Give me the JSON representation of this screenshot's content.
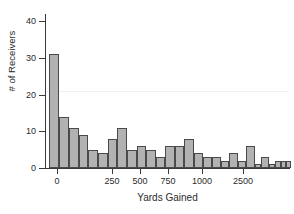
{
  "chart_data": {
    "type": "bar",
    "title": "",
    "xlabel": "Yards Gained",
    "ylabel": "# of Receivers",
    "grid": false,
    "legend": null,
    "ylim": [
      0,
      42
    ],
    "yticks": [
      0,
      10,
      20,
      30,
      40
    ],
    "ytick_labels": [
      "0",
      "10",
      "20",
      "30",
      "40"
    ],
    "xticks": [
      0,
      250,
      500,
      750,
      1000,
      2500
    ],
    "xtick_labels": [
      "0",
      "250",
      "500",
      "750",
      "1000",
      "2500"
    ],
    "xtick_px": [
      57,
      112,
      140,
      168,
      202,
      243
    ],
    "axis_note": "x-axis is non-linear at the upper end; 1000 to 2500 is compressed",
    "bin_width_yards": 50,
    "categories": [
      "0-50",
      "50-100",
      "100-150",
      "150-200",
      "200-250",
      "250-300",
      "300-350",
      "350-400",
      "400-450",
      "450-500",
      "500-550",
      "550-600",
      "600-650",
      "650-700",
      "700-750",
      "750-800",
      "800-850",
      "850-900",
      "900-950",
      "950-1000",
      "1000-1050",
      "1050-1100",
      "1100-1150",
      "1150-1900",
      "1900-2300",
      "2300-2500",
      "2500-2700",
      "2700-2900"
    ],
    "values": [
      31,
      14,
      11,
      9,
      5,
      4,
      8,
      11,
      5,
      6,
      5,
      3,
      6,
      6,
      8,
      4,
      3,
      3,
      2,
      4,
      2,
      6,
      1,
      3,
      1,
      2,
      2,
      2
    ],
    "bars_px": [
      {
        "left": 49,
        "width": 10,
        "value": 31
      },
      {
        "left": 59,
        "width": 10,
        "value": 14
      },
      {
        "left": 69,
        "width": 10,
        "value": 11
      },
      {
        "left": 79,
        "width": 9,
        "value": 9
      },
      {
        "left": 88,
        "width": 10,
        "value": 5
      },
      {
        "left": 98,
        "width": 10,
        "value": 4
      },
      {
        "left": 108,
        "width": 9,
        "value": 8
      },
      {
        "left": 117,
        "width": 10,
        "value": 11
      },
      {
        "left": 127,
        "width": 10,
        "value": 5
      },
      {
        "left": 137,
        "width": 9,
        "value": 6
      },
      {
        "left": 146,
        "width": 10,
        "value": 5
      },
      {
        "left": 156,
        "width": 9,
        "value": 3
      },
      {
        "left": 165,
        "width": 10,
        "value": 6
      },
      {
        "left": 175,
        "width": 9,
        "value": 6
      },
      {
        "left": 184,
        "width": 10,
        "value": 8
      },
      {
        "left": 194,
        "width": 9,
        "value": 4
      },
      {
        "left": 203,
        "width": 9,
        "value": 3
      },
      {
        "left": 212,
        "width": 9,
        "value": 3
      },
      {
        "left": 221,
        "width": 8,
        "value": 2
      },
      {
        "left": 229,
        "width": 9,
        "value": 4
      },
      {
        "left": 238,
        "width": 8,
        "value": 2
      },
      {
        "left": 246,
        "width": 9,
        "value": 6
      },
      {
        "left": 255,
        "width": 6,
        "value": 1
      },
      {
        "left": 261,
        "width": 8,
        "value": 3
      },
      {
        "left": 269,
        "width": 6,
        "value": 1
      },
      {
        "left": 275,
        "width": 6,
        "value": 2
      },
      {
        "left": 281,
        "width": 5,
        "value": 2
      },
      {
        "left": 286,
        "width": 5,
        "value": 2
      }
    ],
    "colors": {
      "bar_fill": "#b2b2b2",
      "bar_edge": "#4a4a4a",
      "axis": "#3a3a3a",
      "text": "#2b2b2b",
      "background": "#ffffff"
    }
  }
}
